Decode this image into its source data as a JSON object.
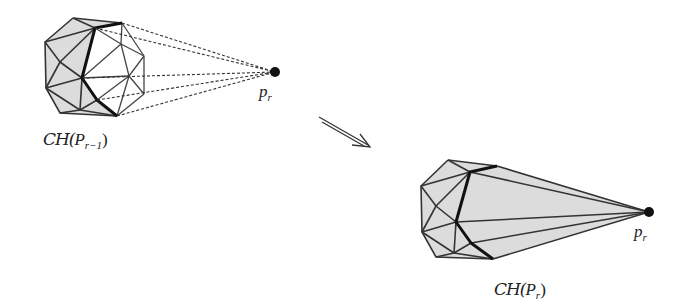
{
  "figure": {
    "type": "convex-hull-incremental-step",
    "left_panel": {
      "caption_prefix": "CH(",
      "caption_var": "P",
      "caption_sub": "r−1",
      "caption_suffix": ")",
      "point_label_var": "p",
      "point_label_sub": "r",
      "point": {
        "x": 275,
        "y": 72
      },
      "fill_color": "#dcdcdc",
      "edge_color": "#333333",
      "silhouette_color": "#111111",
      "tangent_style": "dashed"
    },
    "arrow": {
      "symbol": "implies-arrow",
      "from": {
        "x": 318,
        "y": 117
      },
      "to": {
        "x": 370,
        "y": 147
      }
    },
    "right_panel": {
      "caption_prefix": "CH(",
      "caption_var": "P",
      "caption_sub": "r",
      "caption_suffix": ")",
      "point_label_var": "p",
      "point_label_sub": "r",
      "point": {
        "x": 649,
        "y": 212
      },
      "fill_color": "#dcdcdc",
      "edge_color": "#333333",
      "silhouette_color": "#111111"
    }
  }
}
